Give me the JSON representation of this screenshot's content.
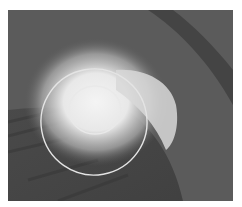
{
  "image": {
    "description": "Grayscale close-up image with a bright glowing spot and a curved dark edge, overlaid with two white circular outlines",
    "colors": {
      "background": "#5c5c5c",
      "dark_region": "#3e3e3e",
      "glow": "#f2f2f2",
      "overlay_stroke": "#e6e6e6"
    },
    "overlays": [
      {
        "type": "ellipse",
        "label": "outer-ring"
      },
      {
        "type": "ellipse",
        "label": "inner-ring"
      }
    ]
  }
}
